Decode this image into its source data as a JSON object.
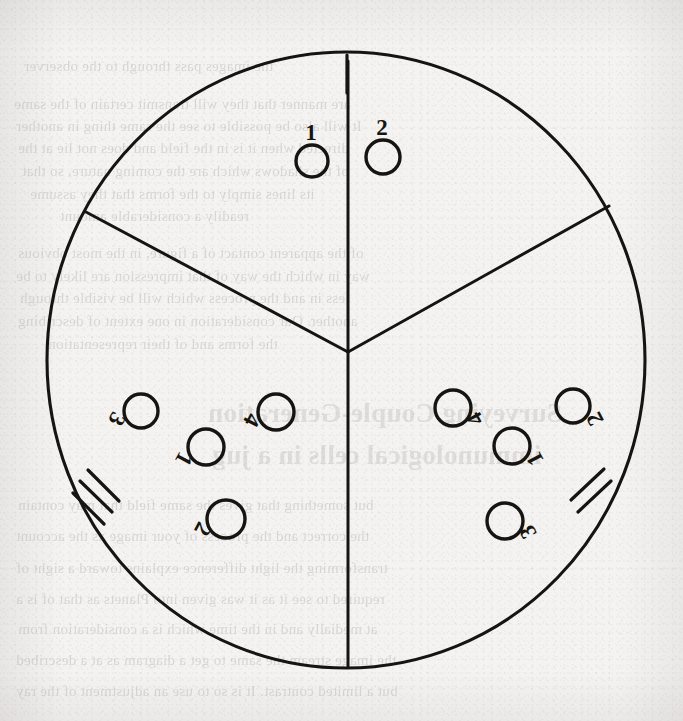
{
  "figure": {
    "stroke_color": "#161410",
    "paper_color": "#f4f3f1",
    "circle": {
      "cx": 346,
      "cy": 360,
      "r": 299
    },
    "center_junction": {
      "x": 348,
      "y": 352
    }
  },
  "sectors": [
    {
      "name": "top-sector",
      "tick_count": 1,
      "tick_label": "1",
      "nodes": [
        {
          "label": "1",
          "cx": 312,
          "cy": 161,
          "r": 16,
          "label_dx": -1,
          "label_dy": -26,
          "rotation": 0
        },
        {
          "label": "2",
          "cx": 383,
          "cy": 157,
          "r": 17,
          "label_dx": -1,
          "label_dy": -27,
          "rotation": 0
        }
      ]
    },
    {
      "name": "lower-left-sector",
      "tick_count": 3,
      "tick_label": "3",
      "nodes": [
        {
          "label": "3",
          "cx": 141,
          "cy": 411,
          "r": 17,
          "label_dx": -26,
          "label_dy": 7,
          "rotation": 118
        },
        {
          "label": "4",
          "cx": 276,
          "cy": 412,
          "r": 18,
          "label_dx": -26,
          "label_dy": 7,
          "rotation": 118
        },
        {
          "label": "1",
          "cx": 206,
          "cy": 447,
          "r": 18,
          "label_dx": -24,
          "label_dy": 11,
          "rotation": 118
        },
        {
          "label": "2",
          "cx": 226,
          "cy": 519,
          "r": 19,
          "label_dx": -25,
          "label_dy": 9,
          "rotation": 118
        }
      ]
    },
    {
      "name": "lower-right-sector",
      "tick_count": 2,
      "tick_label": "2",
      "nodes": [
        {
          "label": "4",
          "cx": 453,
          "cy": 408,
          "r": 18,
          "label_dx": 24,
          "label_dy": 10,
          "rotation": 242
        },
        {
          "label": "2",
          "cx": 573,
          "cy": 406,
          "r": 17,
          "label_dx": 24,
          "label_dy": 12,
          "rotation": 242
        },
        {
          "label": "1",
          "cx": 512,
          "cy": 446,
          "r": 18,
          "label_dx": 25,
          "label_dy": 12,
          "rotation": 242
        },
        {
          "label": "3",
          "cx": 505,
          "cy": 521,
          "r": 18,
          "label_dx": 25,
          "label_dy": 10,
          "rotation": 242
        }
      ]
    }
  ],
  "dividers": [
    {
      "name": "divider-top",
      "x1": 348,
      "y1": 352,
      "x2": 348,
      "y2": 61
    },
    {
      "name": "divider-lower-left",
      "x1": 348,
      "y1": 352,
      "x2": 86,
      "y2": 212
    },
    {
      "name": "divider-lower-right",
      "x1": 348,
      "y1": 352,
      "x2": 609,
      "y2": 206
    },
    {
      "name": "divider-bottom",
      "x1": 348,
      "y1": 352,
      "x2": 348,
      "y2": 667
    }
  ],
  "ticks": {
    "top": [
      {
        "name": "tick-top-1",
        "x1": 347,
        "y1": 55,
        "x2": 347,
        "y2": 93
      }
    ],
    "lower_left": [
      {
        "name": "tick-left-1",
        "x1": 88,
        "y1": 470,
        "x2": 119,
        "y2": 501
      },
      {
        "name": "tick-left-2",
        "x1": 80,
        "y1": 481,
        "x2": 112,
        "y2": 512
      },
      {
        "name": "tick-left-3",
        "x1": 73,
        "y1": 493,
        "x2": 104,
        "y2": 524
      }
    ],
    "lower_right": [
      {
        "name": "tick-right-1",
        "x1": 571,
        "y1": 500,
        "x2": 604,
        "y2": 469
      },
      {
        "name": "tick-right-2",
        "x1": 578,
        "y1": 512,
        "x2": 611,
        "y2": 481
      }
    ]
  },
  "ghost_text": {
    "note": "faint mirrored bleed-through text from the reverse side of the scanned page",
    "lines": [
      {
        "text": "the images pass through to the observer",
        "x": 24,
        "y": 58,
        "size": 15
      },
      {
        "text": "are manner that they will transmit certain of the same",
        "x": 14,
        "y": 96,
        "size": 15
      },
      {
        "text": "It will also be possible to see the same thing in another",
        "x": 16,
        "y": 118,
        "size": 15
      },
      {
        "text": "directed when it is in the field and does not lie at the",
        "x": 18,
        "y": 140,
        "size": 15
      },
      {
        "text": "of the shadows which are the coming nature, so that",
        "x": 22,
        "y": 163,
        "size": 15
      },
      {
        "text": "its lines simply to the forms that they assume",
        "x": 30,
        "y": 186,
        "size": 15
      },
      {
        "text": "readily a considerable amount",
        "x": 60,
        "y": 208,
        "size": 15
      },
      {
        "text": "of the apparent contact of a figure, in the most obvious",
        "x": 18,
        "y": 245,
        "size": 15
      },
      {
        "text": "way in which the way of that impression are likely to be",
        "x": 16,
        "y": 268,
        "size": 15
      },
      {
        "text": "less in and the process which will be visible through",
        "x": 20,
        "y": 290,
        "size": 15
      },
      {
        "text": "another. Our consideration in one extent of describing",
        "x": 18,
        "y": 313,
        "size": 15
      },
      {
        "text": "the forms and of their representation",
        "x": 48,
        "y": 336,
        "size": 15
      },
      {
        "text": "Surveying Couple-Generation",
        "x": 208,
        "y": 398,
        "size": 27,
        "head": true
      },
      {
        "text": "immunological cells in a jug",
        "x": 212,
        "y": 440,
        "size": 27,
        "head": true
      },
      {
        "text": "but something that gives the same field that may contain",
        "x": 18,
        "y": 497,
        "size": 15
      },
      {
        "text": "the correct and the process of your image as the account",
        "x": 16,
        "y": 528,
        "size": 15
      },
      {
        "text": "transforming the light difference explains toward a sight of",
        "x": 16,
        "y": 560,
        "size": 15
      },
      {
        "text": "required to see it as it was given into Planets as that of is a",
        "x": 16,
        "y": 591,
        "size": 15
      },
      {
        "text": "at medially and in the time which is a consideration from",
        "x": 18,
        "y": 621,
        "size": 15
      },
      {
        "text": "the image stream the same to get a diagram as at a described",
        "x": 16,
        "y": 652,
        "size": 15
      },
      {
        "text": "but a limited contrast. It is so to use an adjustment of the ray",
        "x": 16,
        "y": 683,
        "size": 15
      }
    ]
  }
}
